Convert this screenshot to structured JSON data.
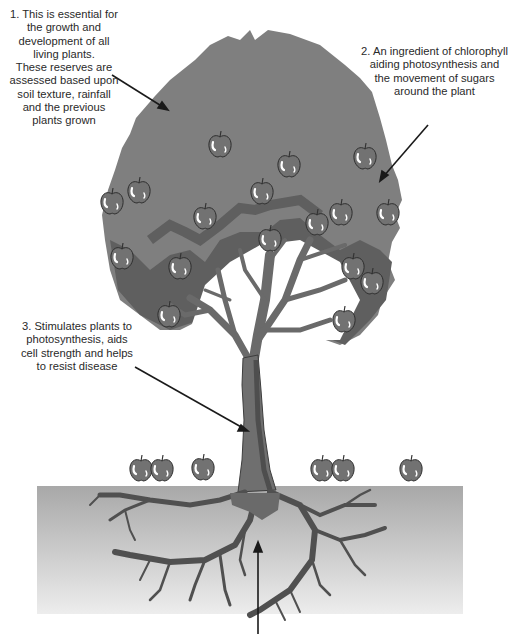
{
  "labels": [
    {
      "id": 1,
      "text": "1. This is essential for\nthe growth and\ndevelopment of all\nliving plants.\nThese reserves are\nassessed based upon\nsoil texture, rainfall\nand the previous\nplants grown",
      "points_to": "canopy"
    },
    {
      "id": 2,
      "text": "2. An ingredient of chlorophyll\naiding photosynthesis and\nthe movement of sugars\naround the plant",
      "points_to": "leaves-edge"
    },
    {
      "id": 3,
      "text": "3. Stimulates plants to\nphotosynthesis, aids\ncell strength and helps\nto resist disease",
      "points_to": "trunk"
    },
    {
      "id": 4,
      "text": "",
      "points_to": "roots"
    }
  ],
  "colors": {
    "canopy": "#7f7f7f",
    "canopy_shadow": "#5e5e5e",
    "apple": "#707070",
    "branch": "#6a6a6a",
    "ground_top": "#a9a9a9",
    "ground_bottom": "#ececec",
    "text": "#2a2a2a",
    "arrow": "#1a1a1a"
  }
}
